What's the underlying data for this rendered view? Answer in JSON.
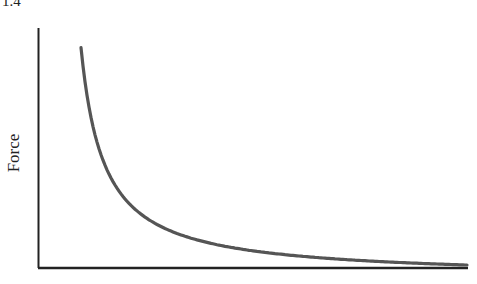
{
  "figure": {
    "label": "1.4"
  },
  "chart_data": {
    "type": "line",
    "title": "",
    "xlabel": "",
    "ylabel": "Force",
    "grid": false,
    "legend": null,
    "ticks": {
      "x": [],
      "y": []
    },
    "series": [
      {
        "name": "Force curve",
        "description": "Inverse relationship: force decreases steeply then asymptotically approaches zero",
        "x": [
          0.1,
          0.15,
          0.2,
          0.3,
          0.4,
          0.5,
          0.6,
          0.8,
          1.0
        ],
        "y": [
          1.0,
          0.55,
          0.35,
          0.18,
          0.11,
          0.07,
          0.05,
          0.03,
          0.02
        ]
      }
    ],
    "axis_color": "#222222",
    "line_color": "#555555"
  }
}
